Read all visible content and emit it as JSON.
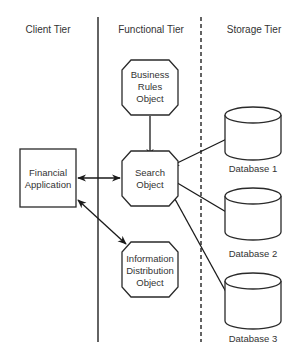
{
  "diagram": {
    "tiers": [
      {
        "id": "client",
        "label": "Client Tier"
      },
      {
        "id": "functional",
        "label": "Functional Tier"
      },
      {
        "id": "storage",
        "label": "Storage Tier"
      }
    ],
    "dividers": [
      {
        "between": [
          "client",
          "functional"
        ],
        "style": "solid"
      },
      {
        "between": [
          "functional",
          "storage"
        ],
        "style": "dashed"
      }
    ],
    "nodes": [
      {
        "id": "financial-application",
        "tier": "client",
        "shape": "rectangle",
        "lines": [
          "Financial",
          "Application"
        ]
      },
      {
        "id": "business-rules-object",
        "tier": "functional",
        "shape": "octagon",
        "lines": [
          "Business",
          "Rules",
          "Object"
        ]
      },
      {
        "id": "search-object",
        "tier": "functional",
        "shape": "octagon",
        "lines": [
          "Search",
          "Object"
        ]
      },
      {
        "id": "information-distribution-object",
        "tier": "functional",
        "shape": "octagon",
        "lines": [
          "Information",
          "Distribution",
          "Object"
        ]
      },
      {
        "id": "database-1",
        "tier": "storage",
        "shape": "cylinder",
        "label": "Database 1"
      },
      {
        "id": "database-2",
        "tier": "storage",
        "shape": "cylinder",
        "label": "Database 2"
      },
      {
        "id": "database-3",
        "tier": "storage",
        "shape": "cylinder",
        "label": "Database 3"
      }
    ],
    "edges": [
      {
        "from": "business-rules-object",
        "to": "search-object",
        "direction": "to"
      },
      {
        "from": "financial-application",
        "to": "search-object",
        "direction": "both"
      },
      {
        "from": "search-object",
        "to": "database-1",
        "direction": "both"
      },
      {
        "from": "search-object",
        "to": "database-2",
        "direction": "both"
      },
      {
        "from": "search-object",
        "to": "database-3",
        "direction": "both"
      },
      {
        "from": "financial-application",
        "to": "information-distribution-object",
        "direction": "both"
      }
    ]
  }
}
